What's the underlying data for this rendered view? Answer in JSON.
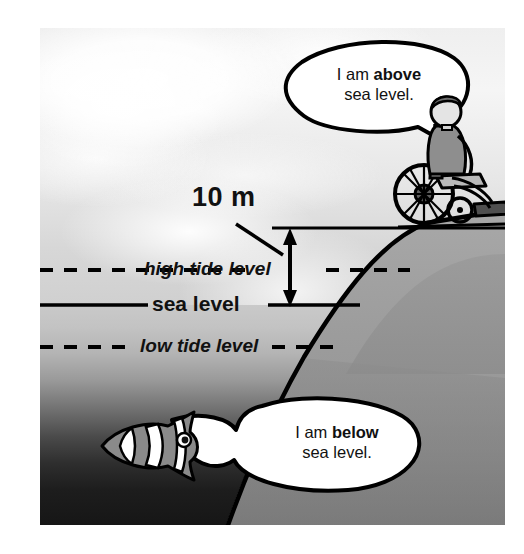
{
  "scene": {
    "title": "Sea level diagram",
    "colors": {
      "sky": "#eeeeee",
      "sea_surface": "#c9c9c9",
      "sea_deep": "#161616",
      "land": "#9d9d9d",
      "line": "#000000",
      "bubble_fill": "#ffffff"
    }
  },
  "measurement": {
    "value_label": "10 m",
    "from": "sea level",
    "to": "cliff top"
  },
  "levels": [
    {
      "id": "high-tide",
      "label": "high tide level",
      "style": "dashed"
    },
    {
      "id": "sea-level",
      "label": "sea level",
      "style": "solid"
    },
    {
      "id": "low-tide",
      "label": "low tide level",
      "style": "dashed"
    }
  ],
  "bubbles": [
    {
      "id": "above",
      "line1_pre": "I am ",
      "line1_strong": "above",
      "line2": "sea level.",
      "speaker": "person-in-wheelchair"
    },
    {
      "id": "below",
      "line1_pre": "I am ",
      "line1_strong": "below",
      "line2": "sea level.",
      "speaker": "clownfish"
    }
  ],
  "figures": [
    {
      "id": "person-in-wheelchair",
      "name": "person in wheelchair on cliff top"
    },
    {
      "id": "clownfish",
      "name": "clownfish under water"
    }
  ]
}
